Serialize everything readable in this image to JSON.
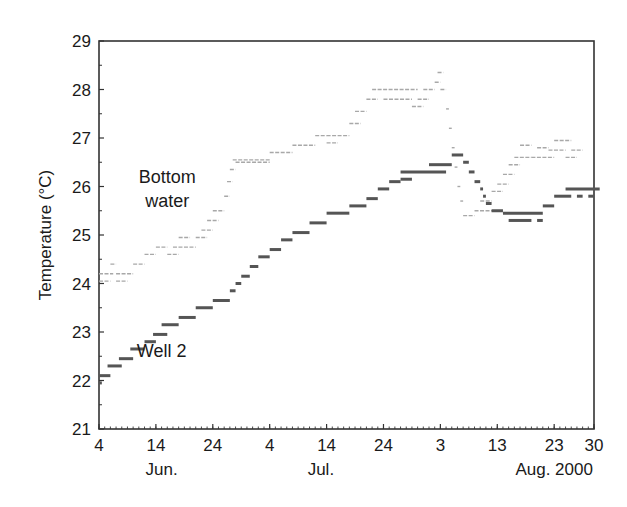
{
  "chart_data": {
    "type": "line",
    "title": "",
    "xlabel": "",
    "ylabel": "Temperature (°C)",
    "ylim": [
      21,
      29
    ],
    "yticks": [
      21,
      22,
      23,
      24,
      25,
      26,
      27,
      28,
      29
    ],
    "xlim_days": [
      0,
      87
    ],
    "x_origin": "Jun. 4, 2000",
    "xticks": [
      {
        "day": 0,
        "label": "4"
      },
      {
        "day": 10,
        "label": "14"
      },
      {
        "day": 20,
        "label": "24"
      },
      {
        "day": 30,
        "label": "4"
      },
      {
        "day": 40,
        "label": "14"
      },
      {
        "day": 50,
        "label": "24"
      },
      {
        "day": 60,
        "label": "3"
      },
      {
        "day": 70,
        "label": "13"
      },
      {
        "day": 80,
        "label": "23"
      },
      {
        "day": 87,
        "label": "30"
      }
    ],
    "month_labels": [
      {
        "day": 11,
        "label": "Jun."
      },
      {
        "day": 39,
        "label": "Jul."
      },
      {
        "day": 80,
        "label": "Aug. 2000"
      }
    ],
    "grid": false,
    "legend": "none (direct annotations)",
    "annotations": [
      {
        "text": "Bottom",
        "day": 12,
        "temp": 26.2
      },
      {
        "text": "water",
        "day": 12,
        "temp": 25.7
      },
      {
        "text": "Well 2",
        "day": 11,
        "temp": 22.6
      }
    ],
    "series": [
      {
        "name": "Bottom water",
        "color": "#a8a8a8",
        "style": "thin dashed step segments",
        "segments": [
          [
            0,
            2.5,
            24.2
          ],
          [
            2,
            3,
            24.4
          ],
          [
            3,
            6,
            24.2
          ],
          [
            0,
            2,
            24.05
          ],
          [
            3,
            5,
            24.05
          ],
          [
            6,
            8,
            24.4
          ],
          [
            8,
            10,
            24.6
          ],
          [
            10,
            12,
            24.75
          ],
          [
            12,
            14,
            24.6
          ],
          [
            13,
            17,
            24.75
          ],
          [
            14,
            16,
            24.95
          ],
          [
            17,
            19,
            24.95
          ],
          [
            18,
            20,
            25.1
          ],
          [
            19,
            21,
            25.3
          ],
          [
            20,
            22,
            25.5
          ],
          [
            22,
            23,
            25.8
          ],
          [
            22.5,
            23.5,
            26.1
          ],
          [
            23,
            24,
            26.35
          ],
          [
            23.5,
            30,
            26.55
          ],
          [
            24,
            30,
            26.5
          ],
          [
            30,
            34,
            26.7
          ],
          [
            34,
            38,
            26.85
          ],
          [
            38,
            40,
            27.05
          ],
          [
            40,
            42,
            26.9
          ],
          [
            40,
            44,
            27.05
          ],
          [
            44,
            46,
            27.3
          ],
          [
            45,
            47,
            27.55
          ],
          [
            47,
            49,
            27.8
          ],
          [
            48,
            56,
            28.0
          ],
          [
            50,
            55,
            27.8
          ],
          [
            55,
            57,
            27.65
          ],
          [
            56,
            58,
            27.8
          ],
          [
            57,
            59,
            28.0
          ],
          [
            59,
            60,
            28.15
          ],
          [
            59.5,
            60.5,
            28.35
          ],
          [
            60,
            61,
            28.0
          ],
          [
            61,
            61.5,
            27.6
          ],
          [
            61.5,
            62,
            27.2
          ],
          [
            62,
            62.5,
            26.8
          ],
          [
            62.5,
            63,
            26.4
          ],
          [
            63,
            63.5,
            26.0
          ],
          [
            63.5,
            64,
            25.7
          ],
          [
            64,
            66,
            25.4
          ],
          [
            66,
            70,
            25.5
          ],
          [
            67,
            69,
            25.7
          ],
          [
            69,
            71,
            25.9
          ],
          [
            70,
            72,
            26.05
          ],
          [
            71,
            73,
            26.25
          ],
          [
            72,
            74,
            26.45
          ],
          [
            73,
            76,
            26.6
          ],
          [
            74,
            76,
            26.85
          ],
          [
            76,
            80,
            26.6
          ],
          [
            77,
            79,
            26.8
          ],
          [
            79,
            82,
            26.75
          ],
          [
            80,
            83,
            26.95
          ],
          [
            82,
            84,
            26.6
          ],
          [
            83,
            85,
            26.75
          ]
        ]
      },
      {
        "name": "Well 2",
        "color": "#555555",
        "style": "thick step segments",
        "segments": [
          [
            0,
            0.5,
            21.95
          ],
          [
            0,
            2,
            22.1
          ],
          [
            1.5,
            4,
            22.3
          ],
          [
            3.5,
            6,
            22.45
          ],
          [
            5.5,
            8,
            22.65
          ],
          [
            8,
            10,
            22.8
          ],
          [
            9.5,
            12,
            22.95
          ],
          [
            11,
            14,
            23.15
          ],
          [
            14,
            17,
            23.3
          ],
          [
            17,
            20,
            23.5
          ],
          [
            20,
            23,
            23.65
          ],
          [
            23,
            24,
            23.85
          ],
          [
            24,
            25,
            24.0
          ],
          [
            25,
            26.5,
            24.15
          ],
          [
            26.5,
            28,
            24.35
          ],
          [
            28,
            30,
            24.55
          ],
          [
            30,
            32,
            24.7
          ],
          [
            32,
            34,
            24.9
          ],
          [
            34,
            37,
            25.05
          ],
          [
            37,
            40,
            25.25
          ],
          [
            40,
            44,
            25.45
          ],
          [
            44,
            47,
            25.6
          ],
          [
            47,
            49,
            25.75
          ],
          [
            49,
            51,
            25.95
          ],
          [
            51,
            53,
            26.1
          ],
          [
            53,
            61,
            26.3
          ],
          [
            53,
            55,
            26.15
          ],
          [
            58,
            62,
            26.45
          ],
          [
            62,
            64,
            26.65
          ],
          [
            64,
            65,
            26.5
          ],
          [
            65,
            66,
            26.3
          ],
          [
            66,
            67,
            26.1
          ],
          [
            67,
            67.5,
            25.95
          ],
          [
            67.5,
            68,
            25.8
          ],
          [
            68,
            69,
            25.65
          ],
          [
            69,
            71,
            25.5
          ],
          [
            71,
            78,
            25.45
          ],
          [
            72,
            76,
            25.3
          ],
          [
            77,
            78,
            25.3
          ],
          [
            78,
            80,
            25.6
          ],
          [
            80,
            83,
            25.8
          ],
          [
            82,
            88,
            25.95
          ],
          [
            84,
            85,
            25.8
          ],
          [
            86,
            87,
            25.8
          ]
        ]
      }
    ]
  }
}
